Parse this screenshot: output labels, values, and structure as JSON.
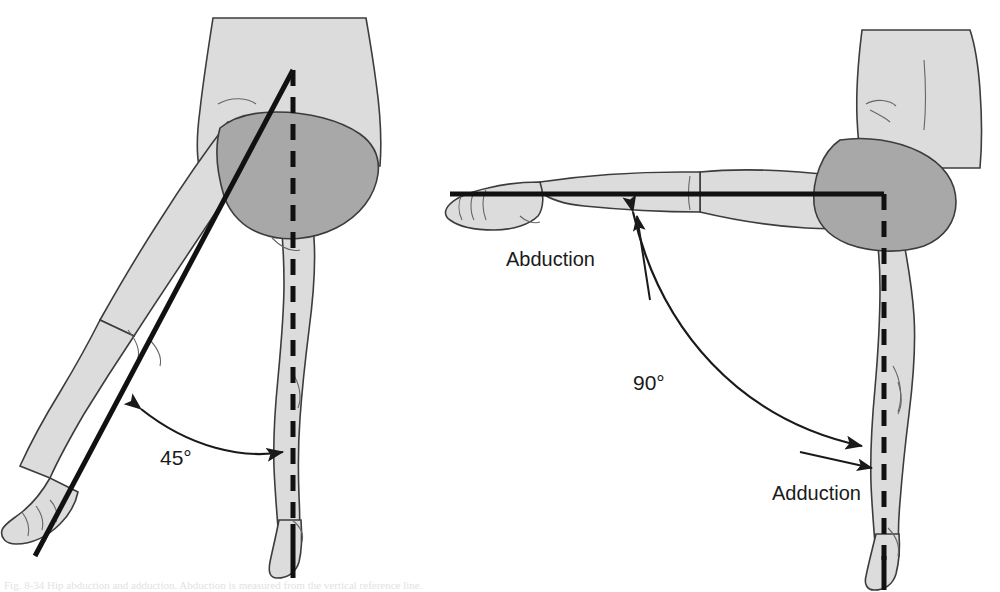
{
  "figure": {
    "background_color": "#ffffff",
    "line_color": "#111111",
    "limb_fill_color": "#dcdcdc",
    "pelvis_fill_color": "#a8a8a8",
    "outline_color": "#3c3c3c",
    "partial_caption": "Fig. 8-34  Hip abduction and adduction. Abduction is measured from the vertical reference line."
  },
  "panels": [
    {
      "id": "left-panel",
      "name": "frontal-view-hip-abduction",
      "angle_label": "45°",
      "angle_value": 45,
      "reference_line": "dashed-vertical-midline",
      "moving_limb_line": "solid-femur-axis",
      "arc_type": "double-headed",
      "labels": []
    },
    {
      "id": "right-panel",
      "name": "frontal-view-hip-abduction-90",
      "angle_label": "90°",
      "angle_value": 90,
      "reference_line": "dashed-vertical-midline",
      "moving_limb_line": "solid-horizontal-femur-axis",
      "arc_type": "double-headed",
      "labels": [
        {
          "text": "Abduction",
          "name": "abduction-label"
        },
        {
          "text": "Adduction",
          "name": "adduction-label"
        }
      ]
    }
  ],
  "text_items": {
    "angle_left": "45°",
    "angle_right": "90°",
    "abduction": "Abduction",
    "adduction": "Adduction"
  }
}
